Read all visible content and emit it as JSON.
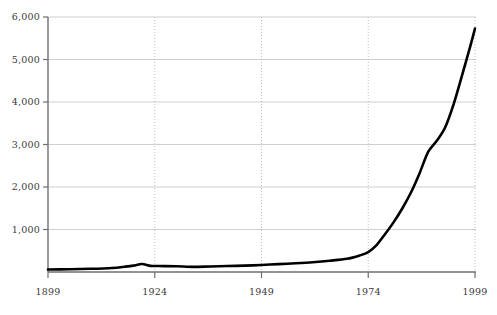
{
  "chart_data": {
    "type": "line",
    "title": "",
    "subtitle": "",
    "xlabel": "",
    "ylabel": "",
    "xlim": [
      1899,
      1999
    ],
    "ylim": [
      0,
      6000
    ],
    "grid": true,
    "legend": false,
    "legend_position": "none",
    "xticks": [
      1899,
      1924,
      1949,
      1974,
      1999
    ],
    "xtick_labels": [
      "1899",
      "1924",
      "1949",
      "1974",
      "1999"
    ],
    "yticks": [
      1000,
      2000,
      3000,
      4000,
      5000,
      6000
    ],
    "ytick_labels": [
      "1,000",
      "2,000",
      "3,000",
      "4,000",
      "5,000",
      "6,000"
    ],
    "series": [
      {
        "name": "value",
        "color": "#000000",
        "x": [
          1899,
          1904,
          1909,
          1914,
          1917,
          1919,
          1921,
          1923,
          1925,
          1929,
          1933,
          1937,
          1941,
          1945,
          1949,
          1953,
          1957,
          1961,
          1965,
          1969,
          1972,
          1974,
          1976,
          1978,
          1980,
          1982,
          1984,
          1986,
          1988,
          1990,
          1992,
          1994,
          1996,
          1998,
          1999
        ],
        "values": [
          60,
          65,
          75,
          95,
          125,
          150,
          190,
          145,
          140,
          135,
          120,
          130,
          140,
          150,
          165,
          185,
          205,
          230,
          265,
          310,
          390,
          470,
          640,
          900,
          1180,
          1500,
          1870,
          2320,
          2820,
          3080,
          3400,
          3950,
          4640,
          5350,
          5730
        ]
      }
    ],
    "axis_color": "#6f6f6f",
    "grid_color": "#c9c9c9",
    "vgrid_color": "#b9b9b9",
    "label_color": "#3b3b3b",
    "background": "#ffffff"
  }
}
